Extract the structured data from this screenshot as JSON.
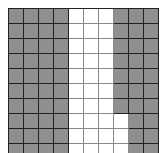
{
  "diagram": {
    "type": "hundred-grid",
    "rows": 10,
    "cols": 10,
    "shaded_color": "#8f8f8f",
    "unshaded_color": "#ffffff",
    "line_color": "#222222",
    "cells": [
      [
        1,
        1,
        1,
        1,
        0,
        0,
        0,
        1,
        1,
        1
      ],
      [
        1,
        1,
        1,
        1,
        0,
        0,
        0,
        1,
        1,
        1
      ],
      [
        1,
        1,
        1,
        1,
        0,
        0,
        0,
        1,
        1,
        1
      ],
      [
        1,
        1,
        1,
        1,
        0,
        0,
        0,
        1,
        1,
        1
      ],
      [
        1,
        1,
        1,
        1,
        0,
        0,
        0,
        1,
        1,
        1
      ],
      [
        1,
        1,
        1,
        1,
        0,
        0,
        0,
        1,
        1,
        1
      ],
      [
        1,
        1,
        1,
        1,
        0,
        0,
        0,
        1,
        1,
        1
      ],
      [
        1,
        1,
        1,
        1,
        0,
        0,
        0,
        0,
        1,
        1
      ],
      [
        1,
        1,
        1,
        1,
        0,
        0,
        0,
        0,
        1,
        1
      ],
      [
        1,
        1,
        1,
        1,
        0,
        0,
        0,
        0,
        1,
        1
      ]
    ],
    "shaded_count": 67,
    "unshaded_count": 33
  }
}
